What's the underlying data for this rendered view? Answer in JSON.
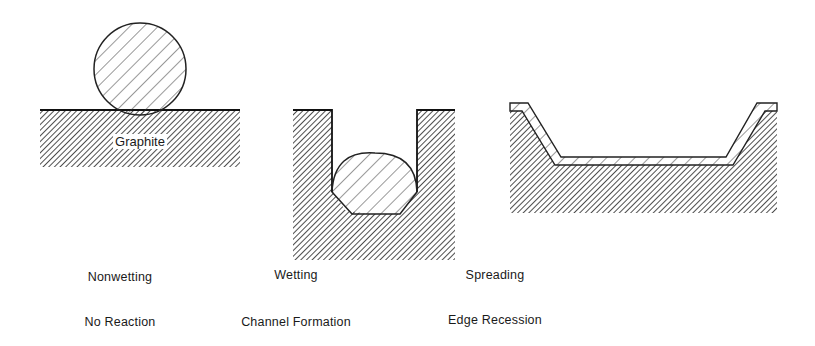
{
  "diagram": {
    "panels": [
      {
        "id": "nonwetting",
        "substrate_label": "Graphite",
        "behavior": "Nonwetting",
        "reaction": "No Reaction"
      },
      {
        "id": "wetting",
        "behavior": "Wetting",
        "reaction": "Channel Formation"
      },
      {
        "id": "spreading",
        "behavior": "Spreading",
        "reaction": "Edge Recession"
      }
    ]
  }
}
